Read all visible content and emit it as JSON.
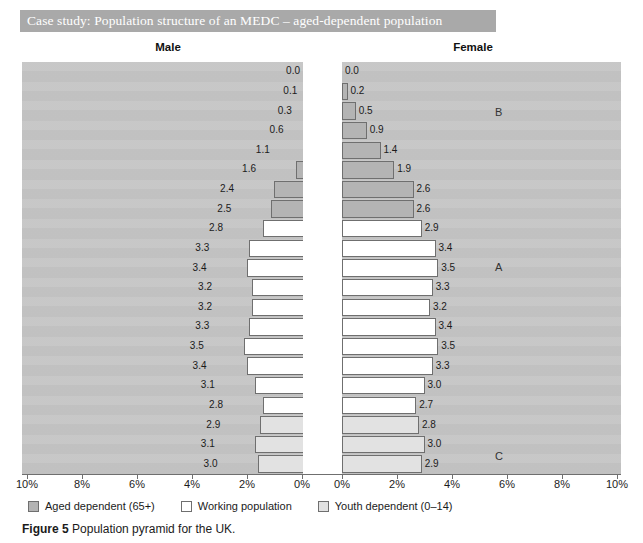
{
  "banner": {
    "title": "Case study: Population structure of an MEDC – aged-dependent population"
  },
  "headings": {
    "male": "Male",
    "female": "Female"
  },
  "caption": {
    "figure_number": "Figure 5",
    "text": "Population pyramid for the UK."
  },
  "legend": {
    "items": [
      {
        "label": "Aged dependent (65+)",
        "color": "#b4b4b4",
        "key": "aged"
      },
      {
        "label": "Working population",
        "color": "#ffffff",
        "key": "working"
      },
      {
        "label": "Youth dependent (0–14)",
        "color": "#e2e2e2",
        "key": "youth"
      }
    ]
  },
  "annotations": [
    {
      "label": "B",
      "x": 495,
      "y": 106
    },
    {
      "label": "A",
      "x": 495,
      "y": 261
    },
    {
      "label": "C",
      "x": 495,
      "y": 450
    }
  ],
  "colors": {
    "banner_background": "#a9a9a9",
    "plot_background": "#c5c5c5",
    "aged_dependent": "#b4b4b4",
    "working_population": "#ffffff",
    "youth_dependent": "#e2e2e2",
    "bar_outline": "#6f6f6f",
    "axis": "#6f6f6f"
  },
  "chart_data": {
    "type": "bar",
    "subtype": "population-pyramid",
    "title": "Population pyramid for the UK.",
    "xlabel": "",
    "ylabel": "",
    "xlim": [
      0,
      10
    ],
    "x_unit": "%",
    "grid": false,
    "legend_position": "bottom-left",
    "axis_ticks": [
      "10%",
      "8%",
      "6%",
      "4%",
      "2%",
      "0%",
      "0%",
      "2%",
      "4%",
      "6%",
      "8%",
      "10%"
    ],
    "left_tick_values": [
      10,
      8,
      6,
      4,
      2,
      0
    ],
    "right_tick_values": [
      0,
      2,
      4,
      6,
      8,
      10
    ],
    "categories": [
      "100+",
      "95–99",
      "90–94",
      "85–89",
      "80–84",
      "75–79",
      "70–74",
      "65–69",
      "60–64",
      "55–59",
      "50–54",
      "45–49",
      "40–44",
      "35–39",
      "30–34",
      "25–29",
      "20–24",
      "15–19",
      "10–14",
      "5–9",
      "0–4"
    ],
    "series": [
      {
        "name": "Male",
        "side": "left",
        "values": [
          0.0,
          0.1,
          0.3,
          0.6,
          1.1,
          1.6,
          2.4,
          2.5,
          2.8,
          3.3,
          3.4,
          3.2,
          3.2,
          3.3,
          3.5,
          3.4,
          3.1,
          2.8,
          2.9,
          3.1,
          3.0
        ]
      },
      {
        "name": "Female",
        "side": "right",
        "values": [
          0.0,
          0.2,
          0.5,
          0.9,
          1.4,
          1.9,
          2.6,
          2.6,
          2.9,
          3.4,
          3.5,
          3.3,
          3.2,
          3.4,
          3.5,
          3.3,
          3.0,
          2.7,
          2.8,
          3.0,
          2.9
        ]
      }
    ],
    "group_by_category": [
      "aged",
      "aged",
      "aged",
      "aged",
      "aged",
      "aged",
      "aged",
      "aged",
      "working",
      "working",
      "working",
      "working",
      "working",
      "working",
      "working",
      "working",
      "working",
      "working",
      "youth",
      "youth",
      "youth"
    ]
  }
}
